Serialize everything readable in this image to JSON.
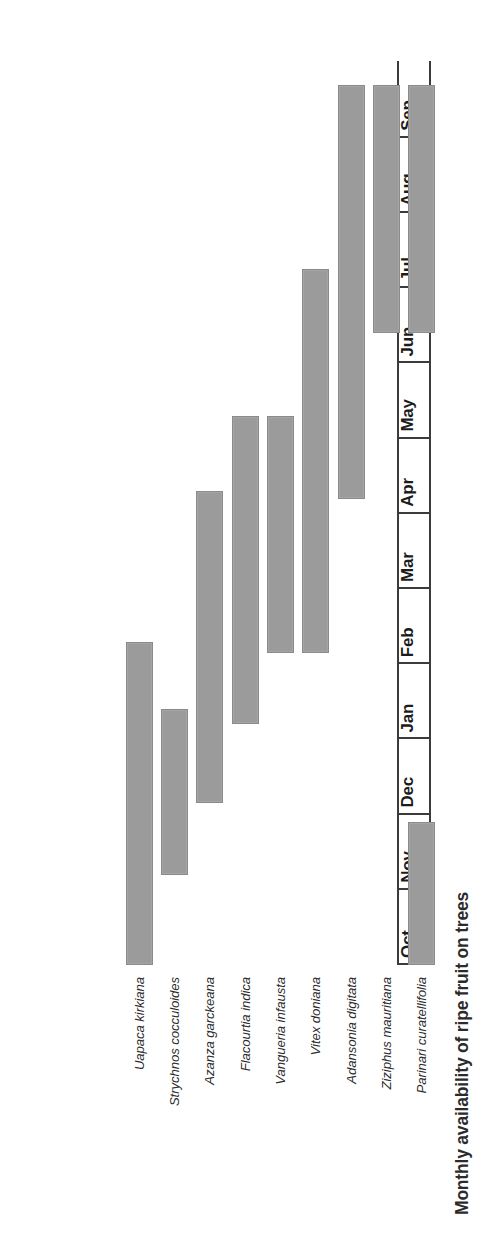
{
  "chart_data": {
    "type": "bar",
    "chart_subtype": "gantt-availability-calendar",
    "title": "Monthly availability of ripe fruit on trees",
    "xlabel": "",
    "ylabel": "",
    "orientation": "rotated-90-ccw",
    "grid": false,
    "legend": null,
    "categories": [
      "Oct",
      "Nov",
      "Dec",
      "Jan",
      "Feb",
      "Mar",
      "Apr",
      "May",
      "Jun",
      "Jul",
      "Aug",
      "Sep"
    ],
    "axis_months": [
      "Oct",
      "Nov",
      "Dec",
      "Jan",
      "Feb",
      "Mar",
      "Apr",
      "May",
      "Jun",
      "Jul",
      "Aug",
      "Sep"
    ],
    "series": [
      {
        "name": "Uapaca kirkiana",
        "start_month": "Oct",
        "end_month": "Feb",
        "months": [
          "Oct",
          "Nov",
          "Dec",
          "Jan",
          "Feb"
        ],
        "start_index": 0,
        "span": 4.3,
        "values": [
          1,
          1,
          1,
          1,
          1,
          0,
          0,
          0,
          0,
          0,
          0,
          0
        ]
      },
      {
        "name": "Strychnos cocculoides",
        "start_month": "Nov",
        "end_month": "Jan",
        "months": [
          "Nov",
          "Dec",
          "Jan"
        ],
        "start_index": 1.2,
        "span": 2.2,
        "values": [
          0,
          1,
          1,
          1,
          0,
          0,
          0,
          0,
          0,
          0,
          0,
          0
        ]
      },
      {
        "name": "Azanza garckeana",
        "start_month": "Dec",
        "end_month": "Mar",
        "months": [
          "Dec",
          "Jan",
          "Feb",
          "Mar"
        ],
        "start_index": 2.15,
        "span": 4.15,
        "values": [
          0,
          0,
          1,
          1,
          1,
          1,
          0,
          0,
          0,
          0,
          0,
          0
        ]
      },
      {
        "name": "Flacourtia indica",
        "start_month": "Jan",
        "end_month": "Apr",
        "months": [
          "Jan",
          "Feb",
          "Mar",
          "Apr"
        ],
        "start_index": 3.2,
        "span": 4.1,
        "values": [
          0,
          0,
          0,
          1,
          1,
          1,
          1,
          0,
          0,
          0,
          0,
          0
        ]
      },
      {
        "name": "Vangueria infausta",
        "start_month": "Feb",
        "end_month": "Apr",
        "months": [
          "Feb",
          "Mar",
          "Apr"
        ],
        "start_index": 4.15,
        "span": 3.15,
        "values": [
          0,
          0,
          0,
          0,
          1,
          1,
          1,
          0,
          0,
          0,
          0,
          0
        ]
      },
      {
        "name": "Vitex doniana",
        "start_month": "Feb",
        "end_month": "Jun",
        "months": [
          "Feb",
          "Mar",
          "Apr",
          "May",
          "Jun"
        ],
        "start_index": 4.15,
        "span": 5.1,
        "values": [
          0,
          0,
          0,
          0,
          1,
          1,
          1,
          1,
          1,
          0,
          0,
          0
        ]
      },
      {
        "name": "Adansonia digitata",
        "start_month": "Apr",
        "end_month": "Aug",
        "months": [
          "Apr",
          "May",
          "Jun",
          "Jul",
          "Aug"
        ],
        "start_index": 6.2,
        "span": 5.5,
        "values": [
          0,
          0,
          0,
          0,
          0,
          0,
          1,
          1,
          1,
          1,
          1,
          0
        ]
      },
      {
        "name": "Ziziphus mauritiana",
        "start_month": "Jun",
        "end_month": "Aug",
        "months": [
          "Jun",
          "Jul",
          "Aug"
        ],
        "start_index": 8.4,
        "span": 3.3,
        "values": [
          0,
          0,
          0,
          0,
          0,
          0,
          0,
          0,
          1,
          1,
          1,
          0
        ]
      },
      {
        "name": "Parinari curatellifolia",
        "start_month": "Oct",
        "end_month": "Dec",
        "months": [
          "Oct",
          "Nov",
          "Dec"
        ],
        "start_index": 0,
        "span": 1.9,
        "values": [
          1,
          1,
          0,
          0,
          0,
          0,
          0,
          0,
          0,
          0,
          0,
          0
        ],
        "note": "second segment Jun-Aug",
        "second_segment": {
          "start_index": 8.4,
          "span": 3.3
        }
      }
    ],
    "species": [
      "Uapaca kirkiana",
      "Strychnos cocculoides",
      "Azanza garckeana",
      "Flacourtia indica",
      "Vangueria infausta",
      "Vitex doniana",
      "Adansonia digitata",
      "Ziziphus mauritiana",
      "Parinari curatellifolia"
    ],
    "colors": {
      "bar_fill": "#9b9b9b",
      "bar_border": "#8a8a8a",
      "axis": "#3b3b3b",
      "title_text": "#2b2b2b",
      "label_text": "#2c2c2c",
      "background": "#ffffff"
    }
  },
  "chart": {
    "title": "Monthly availability of ripe fruit on trees",
    "months": [
      {
        "label": "Oct"
      },
      {
        "label": "Nov"
      },
      {
        "label": "Dec"
      },
      {
        "label": "Jan"
      },
      {
        "label": "Feb"
      },
      {
        "label": "Mar"
      },
      {
        "label": "Apr"
      },
      {
        "label": "May"
      },
      {
        "label": "Jun"
      },
      {
        "label": "Jul"
      },
      {
        "label": "Aug"
      },
      {
        "label": "Sep"
      }
    ],
    "rows": [
      {
        "label": "Uapaca kirkiana"
      },
      {
        "label": "Strychnos cocculoides"
      },
      {
        "label": "Azanza garckeana"
      },
      {
        "label": "Flacourtia indica"
      },
      {
        "label": "Vangueria infausta"
      },
      {
        "label": "Vitex doniana"
      },
      {
        "label": "Adansonia digitata"
      },
      {
        "label": "Ziziphus mauritiana"
      },
      {
        "label": "Parinari curatellifolia"
      }
    ]
  }
}
